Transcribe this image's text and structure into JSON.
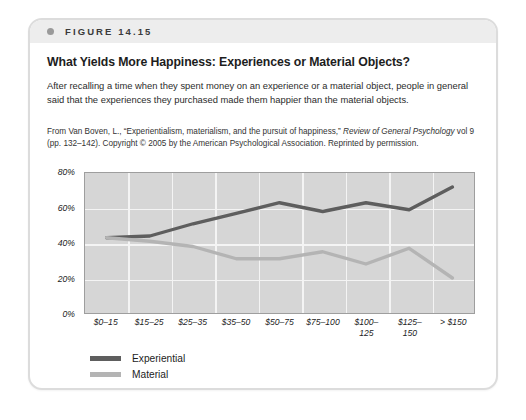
{
  "figure": {
    "label": "FIGURE 14.15",
    "headline": "What Yields More Happiness: Experiences or Material Objects?",
    "caption": "After recalling a time when they spent money on an experience or a material object, people in general said that the experiences they purchased made them happier than the material objects.",
    "source_pre": "From Van Boven, L., “Experientialism, materialism, and the pursuit of happiness,” ",
    "source_italic1": "Review of General Psychology",
    "source_mid": " vol 9 (pp. 132–142). Copyright © 2005 by the American Psychological Association. Reprinted by permission."
  },
  "legend": {
    "items": [
      {
        "label": "Experiential",
        "color": "#5e5e5e"
      },
      {
        "label": "Material",
        "color": "#b4b4b4"
      }
    ]
  },
  "colors": {
    "experiential": "#5e5e5e",
    "material": "#b4b4b4",
    "plot_background": "#d6d6d6",
    "gridline": "#f4f4f4",
    "band": "#ededed"
  },
  "chart_data": {
    "type": "line",
    "title": "What Yields More Happiness: Experiences or Material Objects?",
    "xlabel": "",
    "ylabel": "",
    "categories": [
      "$0–15",
      "$15–25",
      "$25–35",
      "$35–50",
      "$50–75",
      "$75–100",
      "$100–125",
      "$125–150",
      "> $150"
    ],
    "category_lines": [
      [
        "$0–15"
      ],
      [
        "$15–25"
      ],
      [
        "$25–35"
      ],
      [
        "$35–50"
      ],
      [
        "$50–75"
      ],
      [
        "$75–100"
      ],
      [
        "$100–",
        "125"
      ],
      [
        "$125–",
        "150"
      ],
      [
        "> $150"
      ]
    ],
    "series": [
      {
        "name": "Experiential",
        "color": "#5e5e5e",
        "values": [
          43,
          44,
          51,
          57,
          63,
          58,
          63,
          59,
          72
        ]
      },
      {
        "name": "Material",
        "color": "#b4b4b4",
        "values": [
          43,
          41,
          38,
          31,
          31,
          35,
          28,
          37,
          20
        ]
      }
    ],
    "ylim": [
      0,
      80
    ],
    "yticks": [
      0,
      20,
      40,
      60,
      80
    ],
    "ytick_labels": [
      "0%",
      "20%",
      "40%",
      "60%",
      "80%"
    ],
    "grid": true,
    "legend_position": "bottom-left",
    "value_unit": "%"
  }
}
